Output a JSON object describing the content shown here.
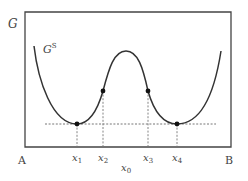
{
  "diagram": {
    "y_axis_label": "G",
    "curve_label": "G",
    "curve_label_sup": "S",
    "left_end_label": "A",
    "right_end_label": "B",
    "x_ticks": [
      {
        "base": "x",
        "sub": "1"
      },
      {
        "base": "x",
        "sub": "2"
      },
      {
        "base": "x",
        "sub": "3"
      },
      {
        "base": "x",
        "sub": "4"
      }
    ],
    "center_label": {
      "base": "x",
      "sub": "0"
    },
    "colors": {
      "curve": "#333333",
      "frame": "#444444",
      "dashed": "#777777",
      "points": "#111111"
    }
  }
}
